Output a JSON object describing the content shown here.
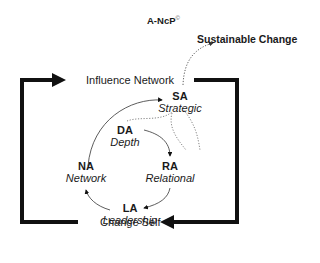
{
  "diagram": {
    "title": "A-NcP",
    "title_mark": "©",
    "outcome": "Sustainable Change",
    "outer_loop": {
      "top_label": "Influence Network",
      "bottom_label": "Change Self"
    },
    "nodes": [
      {
        "abbr": "SA",
        "name": "Strategic"
      },
      {
        "abbr": "DA",
        "name": "Depth"
      },
      {
        "abbr": "RA",
        "name": "Relational"
      },
      {
        "abbr": "LA",
        "name": "Leadership"
      },
      {
        "abbr": "NA",
        "name": "Network"
      }
    ],
    "colors": {
      "line": "#111111",
      "dotted": "#555555",
      "text": "#1a1a1a"
    }
  }
}
